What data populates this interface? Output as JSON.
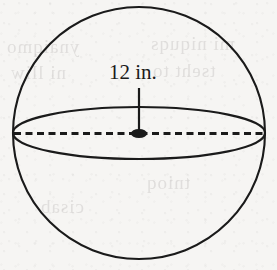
{
  "figure": {
    "name": "sphere-with-diameter",
    "background_color": "#f6f5f3",
    "ink_color": "#1a1a1a",
    "label": {
      "text": "12 in.",
      "value": 12,
      "unit": "in.",
      "measures": "diameter"
    },
    "geometry": {
      "circle": {
        "cx": 139,
        "cy": 133,
        "r": 126
      },
      "equator_ellipse": {
        "cx": 139,
        "cy": 133,
        "rx": 126,
        "ry": 26
      },
      "diameter_line": {
        "x1": 14,
        "y1": 133.5,
        "x2": 264,
        "y2": 133.5,
        "style": "dashed"
      },
      "center_dot": {
        "cx": 139,
        "cy": 133.5,
        "rx": 8,
        "ry": 4.5
      },
      "leader_line": {
        "x1": 139,
        "y1": 88,
        "x2": 139,
        "y2": 130
      }
    }
  },
  "bleed_through": [
    {
      "text": "ynaiqmo",
      "left": 6,
      "top": 36
    },
    {
      "text": "mi niquqs",
      "left": 150,
      "top": 33
    },
    {
      "text": "ni lliw",
      "left": 10,
      "top": 62
    },
    {
      "text": "tseht to",
      "left": 152,
      "top": 60
    },
    {
      "text": "tnioq",
      "left": 146,
      "top": 172
    },
    {
      "text": "cisab",
      "left": 40,
      "top": 196
    }
  ]
}
